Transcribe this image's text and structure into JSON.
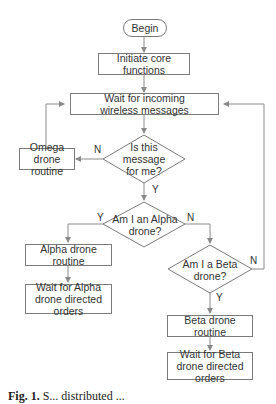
{
  "diagram": {
    "type": "flowchart",
    "nodes": {
      "begin": "Begin",
      "init": "Initiate core functions",
      "wait": "Wait for incoming wireless messages",
      "is_for_me": "Is this message for me?",
      "omega": "Omega drone routine",
      "is_alpha": "Am I an Alpha drone?",
      "alpha_routine": "Alpha drone routine",
      "alpha_wait": "Wait for Alpha drone directed orders",
      "is_beta": "Am I a Beta drone?",
      "beta_routine": "Beta drone routine",
      "beta_wait": "Wait for Beta drone directed orders"
    },
    "edge_labels": {
      "for_me_no": "N",
      "for_me_yes": "Y",
      "alpha_yes": "Y",
      "alpha_no": "N",
      "beta_no": "N",
      "beta_yes": "Y"
    },
    "edges": [
      {
        "from": "begin",
        "to": "init"
      },
      {
        "from": "init",
        "to": "wait"
      },
      {
        "from": "wait",
        "to": "is_for_me"
      },
      {
        "from": "is_for_me",
        "to": "omega",
        "label": "N"
      },
      {
        "from": "omega",
        "to": "wait"
      },
      {
        "from": "is_for_me",
        "to": "is_alpha",
        "label": "Y"
      },
      {
        "from": "is_alpha",
        "to": "alpha_routine",
        "label": "Y"
      },
      {
        "from": "alpha_routine",
        "to": "alpha_wait"
      },
      {
        "from": "is_alpha",
        "to": "is_beta",
        "label": "N"
      },
      {
        "from": "is_beta",
        "to": "wait",
        "label": "N"
      },
      {
        "from": "is_beta",
        "to": "beta_routine",
        "label": "Y"
      },
      {
        "from": "beta_routine",
        "to": "beta_wait"
      }
    ]
  },
  "caption": {
    "prefix": "Fig. 1.",
    "text": "S... distributed ..."
  },
  "colors": {
    "line": "#8a8a8a",
    "border": "#7a7a7a",
    "text": "#333333"
  }
}
